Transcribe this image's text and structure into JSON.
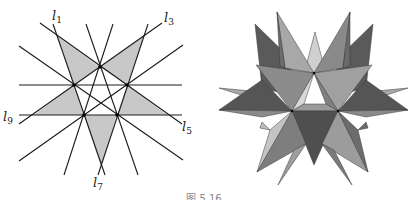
{
  "figure": {
    "caption": "图 5.16",
    "left_diagram": {
      "description": "Ten lines forming a stellated pentagon pattern with five shaded outer triangles",
      "line_color": "#1a1a1a",
      "fill_color": "#c8c8c8",
      "labels": [
        {
          "text": "l",
          "sub": "1",
          "x": 52,
          "y": 20
        },
        {
          "text": "l",
          "sub": "3",
          "x": 164,
          "y": 22
        },
        {
          "text": "l",
          "sub": "5",
          "x": 182,
          "y": 131
        },
        {
          "text": "l",
          "sub": "7",
          "x": 93,
          "y": 187
        },
        {
          "text": "l",
          "sub": "9",
          "x": 3,
          "y": 121
        }
      ],
      "lines": [
        {
          "x1": 53,
          "y1": 24,
          "x2": 105,
          "y2": 175
        },
        {
          "x1": 148,
          "y1": 24,
          "x2": 98,
          "y2": 175
        },
        {
          "x1": 86,
          "y1": 24,
          "x2": 138,
          "y2": 175
        },
        {
          "x1": 113,
          "y1": 24,
          "x2": 64,
          "y2": 175
        },
        {
          "x1": 19,
          "y1": 85,
          "x2": 182,
          "y2": 85
        },
        {
          "x1": 19,
          "y1": 115,
          "x2": 182,
          "y2": 115
        },
        {
          "x1": 40,
          "y1": 23,
          "x2": 182,
          "y2": 124
        },
        {
          "x1": 162,
          "y1": 23,
          "x2": 19,
          "y2": 124
        },
        {
          "x1": 19,
          "y1": 46,
          "x2": 183,
          "y2": 160
        },
        {
          "x1": 19,
          "y1": 161,
          "x2": 183,
          "y2": 45
        }
      ],
      "shaded_triangles": [
        "57,36 100,67 74,85",
        "144,36 100,67 127,85",
        "127,85 117,115 167,115",
        "74,85 84,115 34,115",
        "84,115 117,115 101,167"
      ],
      "vertices": [
        {
          "x": 100,
          "y": 67
        },
        {
          "x": 74,
          "y": 85
        },
        {
          "x": 127,
          "y": 85
        },
        {
          "x": 84,
          "y": 115
        },
        {
          "x": 117,
          "y": 115
        }
      ]
    },
    "right_diagram": {
      "description": "Great stellated dodecahedron rendered in shades of gray",
      "edge_color": "#3a3a3a",
      "faces": [
        {
          "points": "255,24 292,60 290,95 262,88",
          "fill": "#5a5a5a"
        },
        {
          "points": "373,24 336,60 338,95 366,88",
          "fill": "#5a5a5a"
        },
        {
          "points": "315,32 305,70 314,73 325,70",
          "fill": "#d0d0d0"
        },
        {
          "points": "277,12 314,73 285,68",
          "fill": "#a8a8a8"
        },
        {
          "points": "277,12 285,68 280,66",
          "fill": "#6e6e6e"
        },
        {
          "points": "350,12 314,73 343,68",
          "fill": "#8a8a8a"
        },
        {
          "points": "350,12 343,68 350,66",
          "fill": "#6a6a6a"
        },
        {
          "points": "256,65 314,73 292,111",
          "fill": "#8c8c8c"
        },
        {
          "points": "372,65 314,73 338,111",
          "fill": "#a0a0a0"
        },
        {
          "points": "314,73 292,111 304,104",
          "fill": "#d8d8d8"
        },
        {
          "points": "314,73 338,111 326,104",
          "fill": "#808080"
        },
        {
          "points": "292,111 304,104 326,104 338,111",
          "fill": "#9a9a9a"
        },
        {
          "points": "219,88 262,92 292,111",
          "fill": "#a8a8a8"
        },
        {
          "points": "408,88 366,92 338,111",
          "fill": "#a8a8a8"
        },
        {
          "points": "219,110 262,80 292,111",
          "fill": "#555555"
        },
        {
          "points": "408,110 366,80 338,111",
          "fill": "#555555"
        },
        {
          "points": "219,110 292,111 262,117",
          "fill": "#8a8a8a"
        },
        {
          "points": "408,110 338,111 366,117",
          "fill": "#8a8a8a"
        },
        {
          "points": "292,111 338,111 314,165",
          "fill": "#4f4f4f"
        },
        {
          "points": "257,172 292,111 306,144",
          "fill": "#7e7e7e"
        },
        {
          "points": "257,172 292,111 270,130",
          "fill": "#c4c4c4"
        },
        {
          "points": "368,172 338,111 322,144",
          "fill": "#9c9c9c"
        },
        {
          "points": "368,172 338,111 358,130",
          "fill": "#6c6c6c"
        },
        {
          "points": "278,185 306,144 294,150",
          "fill": "#9e9e9e"
        },
        {
          "points": "352,185 322,144 334,150",
          "fill": "#7a7a7a"
        },
        {
          "points": "260,128 270,130 262,122",
          "fill": "#bdbdbd"
        },
        {
          "points": "368,128 358,130 366,122",
          "fill": "#6a6a6a"
        }
      ],
      "vertices": [
        {
          "x": 314,
          "y": 73
        },
        {
          "x": 292,
          "y": 111
        },
        {
          "x": 338,
          "y": 111
        }
      ]
    }
  }
}
